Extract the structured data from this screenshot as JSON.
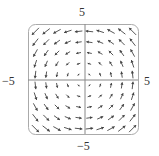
{
  "chart_data": {
    "type": "vector_field",
    "title": "",
    "field": {
      "Fx": "-y",
      "Fy": "x",
      "description": "counterclockwise rotation field"
    },
    "xlim": [
      -5,
      5
    ],
    "ylim": [
      -5,
      5
    ],
    "grid_points": [
      -4.5,
      -3.5,
      -2.5,
      -1.5,
      -0.5,
      0.5,
      1.5,
      2.5,
      3.5,
      4.5
    ],
    "tick_labels": {
      "top": "5",
      "bottom": "−5",
      "left": "−5",
      "right": "5"
    },
    "grid": false,
    "legend": null,
    "axes_color": "#888888",
    "arrow_color": "#444444",
    "frame": "rounded-square"
  },
  "labels": {
    "top": "5",
    "left": "−5",
    "right": "5",
    "bottom": "−5"
  }
}
